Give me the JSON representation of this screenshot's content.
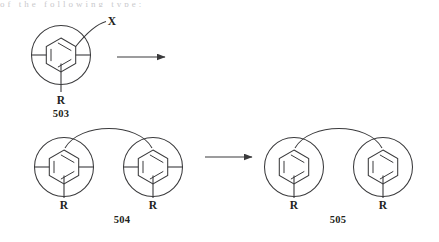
{
  "figure": {
    "type": "chemical-reaction-scheme",
    "clipped_header_text": "of the following type:",
    "stroke_color": "#3a3a3c",
    "text_color": "#231f20",
    "background_color": "#ffffff"
  },
  "structures": [
    {
      "id": "503",
      "number_label": "503",
      "ring_count": 1,
      "ring_type": "benzene-aromatic-circled",
      "has_side_chain_bonds": true,
      "substituents": [
        {
          "label": "X",
          "position": "upper-right",
          "connector": "curved"
        },
        {
          "label": "R",
          "position": "bottom",
          "connector": "straight"
        }
      ]
    },
    {
      "id": "504",
      "number_label": "504",
      "ring_count": 2,
      "ring_type": "benzene-aromatic-circled",
      "has_side_chain_bonds": true,
      "linker": "top-arc",
      "substituents": [
        {
          "label": "R",
          "position": "bottom",
          "connector": "straight"
        },
        {
          "label": "R",
          "position": "bottom",
          "connector": "straight"
        }
      ]
    },
    {
      "id": "505",
      "number_label": "505",
      "ring_count": 2,
      "ring_type": "benzene-aromatic-circled",
      "has_side_chain_bonds": false,
      "linker": "top-arc",
      "substituents": [
        {
          "label": "R",
          "position": "bottom",
          "connector": "straight"
        },
        {
          "label": "R",
          "position": "bottom",
          "connector": "straight"
        }
      ]
    }
  ],
  "arrows": [
    {
      "id": "arrow-1",
      "direction": "right",
      "from": "503",
      "to": "504"
    },
    {
      "id": "arrow-2",
      "direction": "right",
      "from": "504",
      "to": "505"
    }
  ]
}
